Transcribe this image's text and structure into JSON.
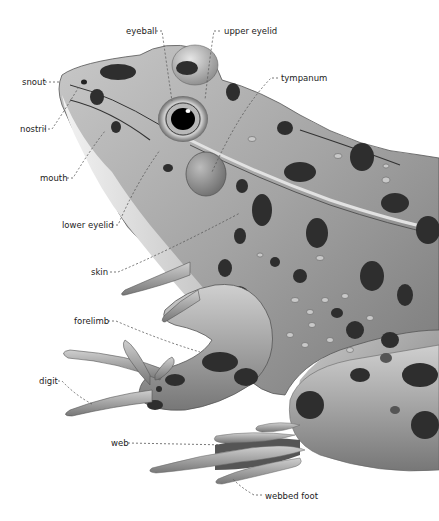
{
  "diagram": {
    "labels": [
      {
        "id": "eyeball",
        "text": "eyeball",
        "x": 126,
        "y": 27
      },
      {
        "id": "upper-eyelid",
        "text": "upper eyelid",
        "x": 224,
        "y": 27
      },
      {
        "id": "snout",
        "text": "snout",
        "x": 22,
        "y": 78
      },
      {
        "id": "tympanum",
        "text": "tympanum",
        "x": 281,
        "y": 74
      },
      {
        "id": "nostril",
        "text": "nostril",
        "x": 20,
        "y": 125
      },
      {
        "id": "mouth",
        "text": "mouth",
        "x": 40,
        "y": 174
      },
      {
        "id": "lower-eyelid",
        "text": "lower eyelid",
        "x": 62,
        "y": 221
      },
      {
        "id": "skin",
        "text": "skin",
        "x": 91,
        "y": 268
      },
      {
        "id": "forelimb",
        "text": "forelimb",
        "x": 74,
        "y": 317
      },
      {
        "id": "digit",
        "text": "digit",
        "x": 39,
        "y": 377
      },
      {
        "id": "web",
        "text": "web",
        "x": 111,
        "y": 439
      },
      {
        "id": "webbed-foot",
        "text": "webbed foot",
        "x": 265,
        "y": 492
      }
    ],
    "colors": {
      "background": "#ffffff",
      "skin_light": "#d8d8d8",
      "skin_mid": "#9a9a9a",
      "skin_dark": "#5e5e5e",
      "spot": "#2e2e2e",
      "label_text": "#222222",
      "leader_line": "#555555"
    }
  }
}
